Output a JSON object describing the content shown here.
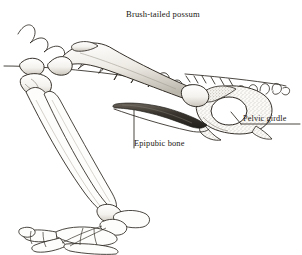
{
  "figure": {
    "title": "Brush-tailed possum",
    "domain_subject": "marsupial pelvic and hind limb skeleton, lateral view",
    "background_color": "#ffffff",
    "ink_color": "#2b2620",
    "bone_fill_color": "#fdfdfb",
    "shading_color": "#b9b4ab",
    "epipubic_bone_color": "#3a352e"
  },
  "labels": [
    {
      "id": "epipubic",
      "text": "Epipubic bone",
      "leader": "vertical-line-up",
      "points_to": "epipubic-bone"
    },
    {
      "id": "pelvic",
      "text": "Pelvic girdle",
      "leader": "underline-with-diagonal",
      "points_to": "pelvic-girdle"
    }
  ],
  "structures": [
    "vertebral-column",
    "sacrum",
    "caudal-vertebrae",
    "pelvic-girdle",
    "acetabulum",
    "epipubic-bone",
    "femur",
    "patella",
    "tibia",
    "fibula",
    "calcaneus",
    "tarsals",
    "metatarsals",
    "phalanges"
  ]
}
